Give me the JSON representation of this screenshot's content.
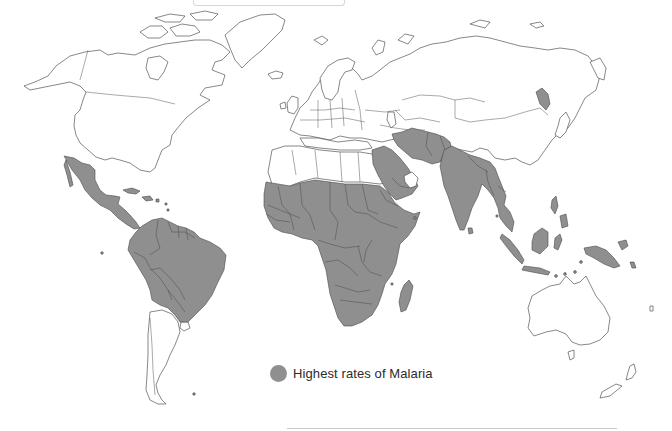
{
  "map": {
    "type": "world choropleth",
    "subject": "Malaria risk regions",
    "fill_color_highlight": "#8f8f8f",
    "fill_color_default": "#ffffff",
    "outline_color": "#555555",
    "highlighted_regions": [
      "Mexico",
      "Central America",
      "Caribbean",
      "Northern & Central South America",
      "Brazil",
      "Sub-Saharan Africa",
      "Madagascar",
      "Arabian Peninsula",
      "Iran",
      "Afghanistan",
      "Pakistan",
      "India",
      "Southeast Asia",
      "Indonesia",
      "Papua New Guinea",
      "North Korea"
    ]
  },
  "legend": {
    "items": [
      {
        "label": "Highest rates of Malaria",
        "color": "#8f8f8f",
        "shape": "circle"
      }
    ]
  }
}
